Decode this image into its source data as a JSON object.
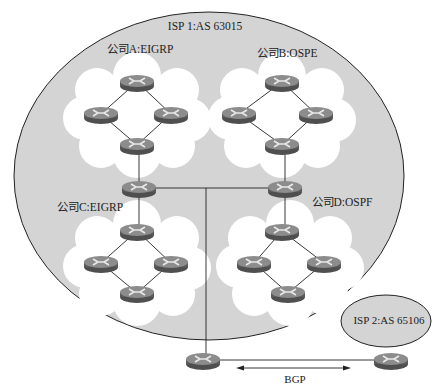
{
  "diagram": {
    "isp1": {
      "label": "ISP 1:AS 63015",
      "fill": "#d4d4d4"
    },
    "isp2": {
      "label": "ISP 2:AS 65106",
      "fill": "#d4d4d4"
    },
    "companies": [
      {
        "id": "A",
        "label": "公司A:EIGRP"
      },
      {
        "id": "B",
        "label": "公司B:OSPE"
      },
      {
        "id": "C",
        "label": "公司C:EIGRP"
      },
      {
        "id": "D",
        "label": "公司D:OSPF"
      }
    ],
    "link_label": "BGP",
    "colors": {
      "cloud": "#ffffff",
      "router_top": "#8a8a8a",
      "router_side": "#555555",
      "line": "#222222"
    }
  }
}
